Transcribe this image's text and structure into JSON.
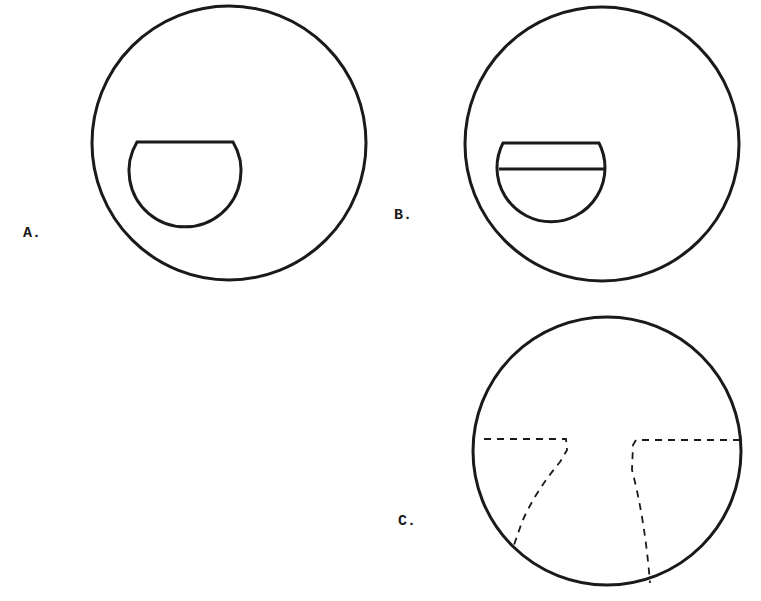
{
  "figure": {
    "panels": [
      {
        "id": "A",
        "label": "A.",
        "description": "Large circle containing a D-shaped (truncated semicircle) inset with flat top edge"
      },
      {
        "id": "B",
        "label": "B.",
        "description": "Large circle containing a truncated semicircle inset divided by a horizontal line"
      },
      {
        "id": "C",
        "label": "C.",
        "description": "Large circle with two dashed outlines forming horizontal lines meeting near center that descend to the lower circumference"
      }
    ],
    "colors": {
      "stroke": "#1a1a1a",
      "background": "#ffffff"
    }
  }
}
